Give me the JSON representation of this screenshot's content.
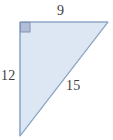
{
  "figure": {
    "kind": "right-triangle-diagram",
    "canvas": {
      "width": 113,
      "height": 140
    },
    "background_color": "#ffffff",
    "shape": {
      "name": "right-triangle",
      "fill_color": "#dde7f4",
      "stroke_color": "#8fa8c8",
      "stroke_width": 1,
      "vertices": [
        {
          "name": "top-left-right-angle",
          "x": 20,
          "y": 22
        },
        {
          "name": "top-right",
          "x": 108,
          "y": 22
        },
        {
          "name": "bottom-left",
          "x": 20,
          "y": 136
        }
      ]
    },
    "right_angle_marker": {
      "name": "right-angle-square",
      "x": 20,
      "y": 22,
      "size": 10,
      "fill_color": "#b3bed6",
      "stroke_color": "#8292b4"
    },
    "labels": {
      "top": "9",
      "left": "12",
      "hypotenuse": "15"
    },
    "label_color": "#3d3d3d"
  }
}
